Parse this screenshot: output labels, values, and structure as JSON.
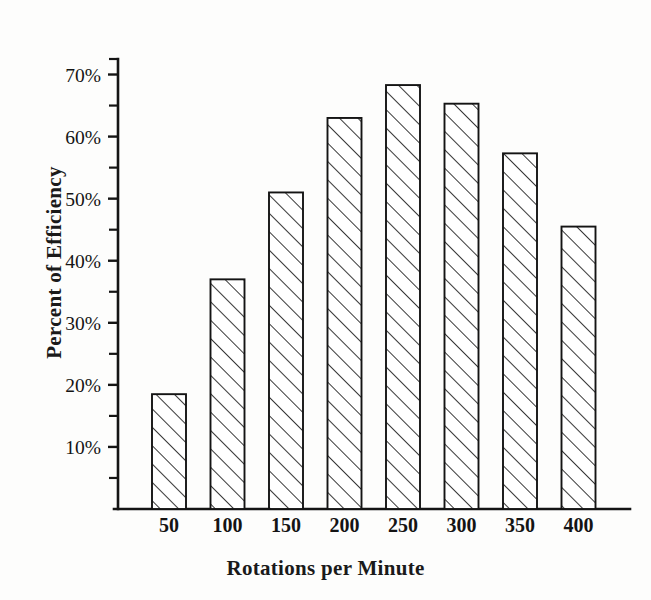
{
  "chart_data": {
    "type": "bar",
    "title": "",
    "subtitle": "",
    "xlabel": "Rotations per Minute",
    "ylabel": "Percent of Efficiency",
    "categories": [
      "50",
      "100",
      "150",
      "200",
      "250",
      "300",
      "350",
      "400"
    ],
    "values": [
      18.5,
      37,
      51,
      63,
      68.3,
      65.3,
      57.3,
      45.5
    ],
    "ylim": [
      0,
      72.5
    ],
    "ytick_values": [
      10,
      20,
      30,
      40,
      50,
      60,
      70
    ],
    "ytick_labels": [
      "10%",
      "20%",
      "30%",
      "40%",
      "50%",
      "60%",
      "70%"
    ],
    "yminor_tick_values": [
      5,
      15,
      25,
      35,
      45,
      55,
      65,
      72.5
    ],
    "grid": false,
    "legend": null,
    "legend_position": "none",
    "bar_fill": "diagonal-hatch",
    "bar_edge_color": "#141414",
    "axis_color": "#141414",
    "background_color": "#fdfdfc"
  },
  "axes": {
    "y_title": "Percent of Efficiency",
    "x_title": "Rotations per Minute"
  }
}
